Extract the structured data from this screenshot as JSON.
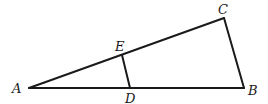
{
  "diagram": {
    "type": "geometry-triangle",
    "points": {
      "A": {
        "label": "A",
        "x": 29,
        "y": 88
      },
      "B": {
        "label": "B",
        "x": 244,
        "y": 88
      },
      "C": {
        "label": "C",
        "x": 224,
        "y": 18
      },
      "D": {
        "label": "D",
        "x": 130,
        "y": 88
      },
      "E": {
        "label": "E",
        "x": 122,
        "y": 55
      }
    },
    "segments": [
      {
        "from": "A",
        "to": "B"
      },
      {
        "from": "A",
        "to": "C"
      },
      {
        "from": "C",
        "to": "B"
      },
      {
        "from": "E",
        "to": "D"
      }
    ],
    "labels": {
      "A": "A",
      "B": "B",
      "C": "C",
      "D": "D",
      "E": "E"
    },
    "colors": {
      "stroke": "#1a1a1a",
      "background": "#ffffff"
    }
  }
}
